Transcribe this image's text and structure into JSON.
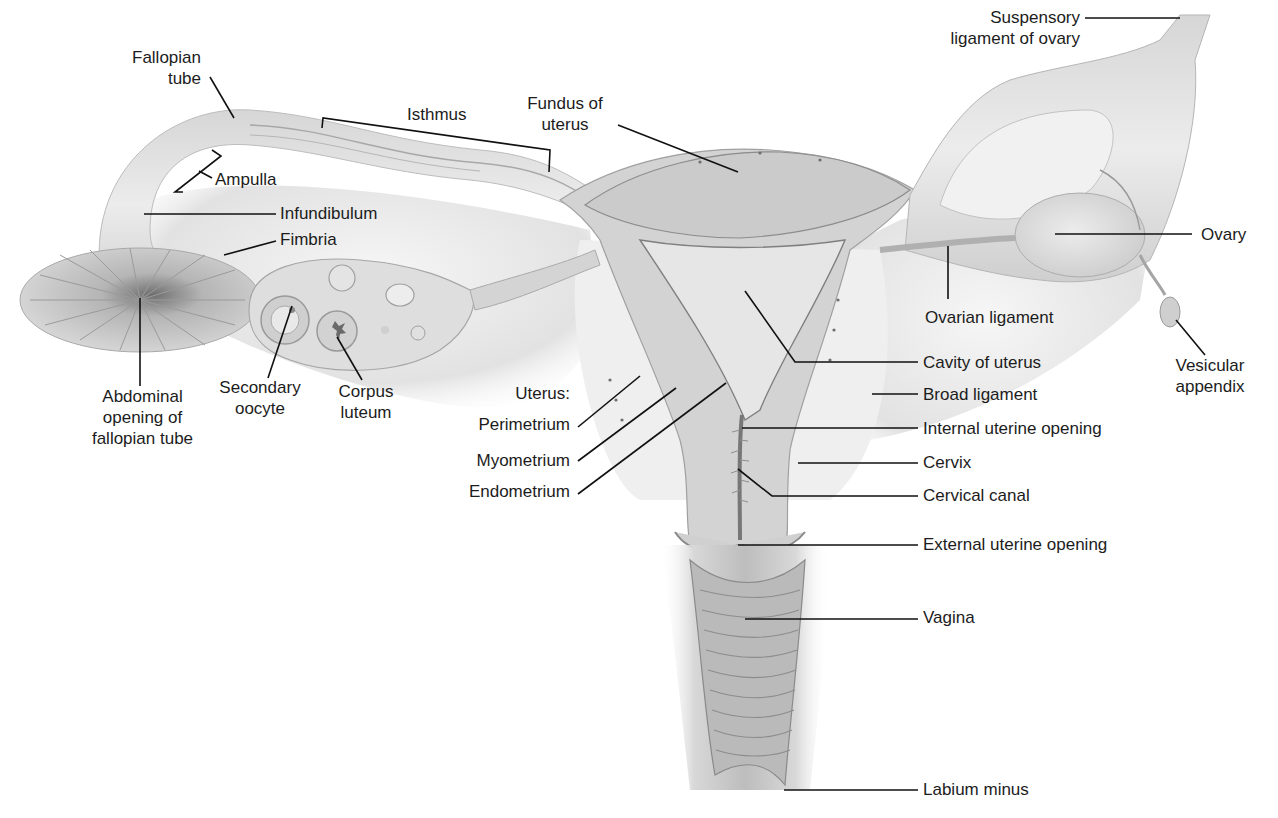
{
  "diagram": {
    "type": "anatomical-illustration",
    "colors": {
      "background": "#ffffff",
      "tissue_light": "#e4e4e4",
      "tissue_mid": "#c9c9c9",
      "tissue_dark": "#9a9a9a",
      "leader_line": "#111111",
      "label_text": "#1c1c1c"
    },
    "labels": {
      "fallopian_tube": [
        "Fallopian",
        "tube"
      ],
      "isthmus": "Isthmus",
      "fundus": [
        "Fundus of",
        "uterus"
      ],
      "suspensory": [
        "Suspensory",
        "ligament of ovary"
      ],
      "ampulla": "Ampulla",
      "infundibulum": "Infundibulum",
      "fimbria": "Fimbria",
      "ovary": "Ovary",
      "ovarian_ligament": "Ovarian ligament",
      "vesicular_appendix": [
        "Vesicular",
        "appendix"
      ],
      "cavity": "Cavity of uterus",
      "broad_ligament": "Broad ligament",
      "abdominal_opening": [
        "Abdominal",
        "opening of",
        "fallopian tube"
      ],
      "secondary_oocyte": [
        "Secondary",
        "oocyte"
      ],
      "corpus_luteum": [
        "Corpus",
        "luteum"
      ],
      "uterus_heading": "Uterus:",
      "perimetrium": "Perimetrium",
      "myometrium": "Myometrium",
      "endometrium": "Endometrium",
      "internal_opening": "Internal uterine opening",
      "cervix": "Cervix",
      "cervical_canal": "Cervical canal",
      "external_opening": "External uterine opening",
      "vagina": "Vagina",
      "labium_minus": "Labium minus"
    }
  }
}
